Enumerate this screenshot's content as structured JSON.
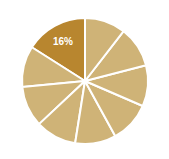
{
  "chart_data": {
    "type": "pie",
    "title": "",
    "subtitle": "",
    "xlabel": "",
    "ylabel": "",
    "grid": false,
    "legend": "none",
    "start_angle_deg": 90,
    "direction": "counterclockwise",
    "center": {
      "cx": 85,
      "cy": 81
    },
    "radius": 63,
    "separator_color": "#ffffff",
    "separator_width": 2,
    "background_color": "#ffffff",
    "labels": [
      "16%",
      "",
      "",
      "",
      "",
      "",
      "",
      "",
      ""
    ],
    "categories": [
      "Slice 1",
      "Slice 2",
      "Slice 3",
      "Slice 4",
      "Slice 5",
      "Slice 6",
      "Slice 7",
      "Slice 8",
      "Slice 9"
    ],
    "values": [
      16,
      10.5,
      10.5,
      10.5,
      10.5,
      10.5,
      10.5,
      10.5,
      10.5
    ],
    "colors": [
      "#b8862f",
      "#cfb377",
      "#cfb377",
      "#cfb377",
      "#cfb377",
      "#cfb377",
      "#cfb377",
      "#cfb377",
      "#cfb377"
    ],
    "annotations": [
      {
        "text": "16%",
        "slice_index": 0,
        "color": "#ffffff",
        "x": 63,
        "y": 42
      }
    ],
    "highlight_color": "#b8862f",
    "base_color": "#cfb377"
  }
}
